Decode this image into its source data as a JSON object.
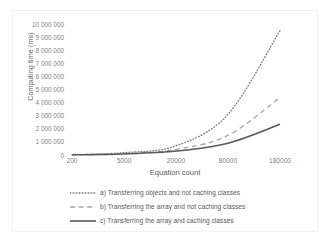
{
  "chart_data": {
    "type": "line",
    "title": "",
    "xlabel": "Equation count",
    "ylabel": "Computing time (ms)",
    "x_tick_labels": [
      "200",
      "5000",
      "20000",
      "80000",
      "180000"
    ],
    "x_categories": [
      200,
      5000,
      20000,
      80000,
      180000
    ],
    "y_tick_labels": [
      "10 000 000",
      "9 000 000",
      "8 000 000",
      "7 000 000",
      "6 000 000",
      "5 000 000",
      "4 000 000",
      "3 000 000",
      "2 000 000",
      "1 000 000",
      "0"
    ],
    "y_tick_values": [
      10000000,
      9000000,
      8000000,
      7000000,
      6000000,
      5000000,
      4000000,
      3000000,
      2000000,
      1000000,
      0
    ],
    "ylim": [
      0,
      10000000
    ],
    "grid": false,
    "legend_position": "bottom",
    "series": [
      {
        "name": "a) Transferring objects and not caching classes",
        "style": "dotted",
        "color": "#808080",
        "values": [
          30000,
          180000,
          700000,
          3100000,
          9500000
        ]
      },
      {
        "name": "b) Transferring the array and not caching classes",
        "style": "dashed",
        "color": "#a6a6a6",
        "values": [
          20000,
          110000,
          420000,
          1500000,
          4400000
        ]
      },
      {
        "name": "c) Transferring the array and caching classes",
        "style": "solid",
        "color": "#595959",
        "values": [
          15000,
          80000,
          300000,
          900000,
          2350000
        ]
      }
    ]
  },
  "legend": {
    "items": [
      {
        "label": "a) Transferring objects and not caching classes"
      },
      {
        "label": "b) Transferring the array and not caching classes"
      },
      {
        "label": "c) Transferring the array and caching classes"
      }
    ]
  },
  "colors": {
    "series_a": "#808080",
    "series_b": "#a6a6a6",
    "series_c": "#595959",
    "axis_text": "#808080",
    "title_text": "#595959",
    "frame": "#f2f2f2",
    "background": "#ffffff"
  }
}
